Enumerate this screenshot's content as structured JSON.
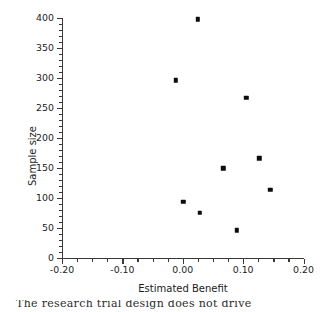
{
  "figure": {
    "background_color": "#ffffff",
    "axis_color": "#3a3a3a",
    "marker_color": "#0d0d0d"
  },
  "caption": {
    "partial_text": "The research trial design does not drive"
  },
  "chart_data": {
    "type": "scatter",
    "title": "",
    "xlabel": "Estimated Benefit",
    "ylabel": "Sample size",
    "xlim": [
      -0.2,
      0.2
    ],
    "ylim": [
      0,
      400
    ],
    "grid": false,
    "legend": null,
    "x_ticks": [
      -0.2,
      -0.1,
      0.0,
      0.1,
      0.2
    ],
    "x_tick_labels": [
      "-0.20",
      "-0.10",
      "0.00",
      "0.10",
      "0.20"
    ],
    "x_minor_tick_step": 0.025,
    "y_ticks": [
      0,
      50,
      100,
      150,
      200,
      250,
      300,
      350,
      400
    ],
    "y_tick_labels": [
      "0",
      "50",
      "100",
      "150",
      "200",
      "250",
      "300",
      "350",
      "400"
    ],
    "y_minor_tick_step": 10,
    "series": [
      {
        "name": "trials",
        "marker": "square",
        "points": [
          {
            "x": 0.025,
            "y": 398
          },
          {
            "x": -0.012,
            "y": 296
          },
          {
            "x": 0.105,
            "y": 267
          },
          {
            "x": 0.127,
            "y": 166
          },
          {
            "x": 0.067,
            "y": 149
          },
          {
            "x": 0.145,
            "y": 113
          },
          {
            "x": 0.001,
            "y": 93
          },
          {
            "x": 0.028,
            "y": 75
          },
          {
            "x": 0.09,
            "y": 46
          }
        ]
      }
    ]
  }
}
